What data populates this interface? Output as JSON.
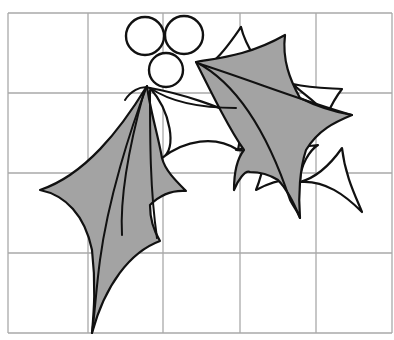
{
  "figure": {
    "colors": {
      "background": "#ffffff",
      "grid": "#a9a9a9",
      "outline": "#111111",
      "leaf_fill": "#a3a3a3",
      "berry_fill": "#ffffff"
    },
    "grid": {
      "left": 8,
      "top": 13,
      "right": 392,
      "bottom": 333,
      "columns": 5,
      "rows": 4,
      "vertical_lines": [
        8,
        88,
        163,
        240,
        316,
        392
      ],
      "horizontal_lines": [
        13,
        93,
        173,
        253,
        333
      ]
    },
    "berries": [
      {
        "name": "berry-left",
        "cx": 145,
        "cy": 36,
        "r": 19
      },
      {
        "name": "berry-right",
        "cx": 184,
        "cy": 35,
        "r": 19
      },
      {
        "name": "berry-bottom",
        "cx": 166,
        "cy": 70,
        "r": 17
      }
    ],
    "back_leaves": [
      {
        "name": "back-leaf-lower",
        "d": "M150 88 C170 110 178 150 162 158 C185 140 215 135 238 150 C240 138 242 128 250 120 C225 110 190 95 150 88 Z"
      },
      {
        "name": "back-leaf-lower-right",
        "d": "M236 150 C250 150 258 158 264 160 C262 175 258 185 256 190 C275 180 290 178 300 182 C300 165 310 150 318 145 C290 150 270 140 236 150 Z"
      },
      {
        "name": "back-leaf-right",
        "d": "M300 182 C325 180 345 195 362 212 C355 195 345 175 342 148 C330 165 315 178 300 182 Z"
      },
      {
        "name": "back-leaf-top",
        "d": "M212 62 C222 55 232 40 241 27 C244 40 250 50 255 58 C240 62 225 62 212 62 Z"
      },
      {
        "name": "back-leaf-top-right",
        "d": "M293 84 C310 88 325 88 342 89 C335 98 330 108 327 115 C315 100 300 92 293 84 Z"
      }
    ],
    "front_leaves": [
      {
        "name": "left-leaf",
        "d": "M147 86 C120 130 85 175 40 190 C65 195 85 215 92 250 C96 285 94 310 92 333 C105 285 130 252 160 241 C152 228 150 215 150 205 C160 195 172 190 186 191 C175 180 165 170 162 158 C158 135 150 110 147 86 Z"
      },
      {
        "name": "right-leaf",
        "d": "M196 62 C218 58 248 56 285 35 C282 60 290 80 300 98 C320 108 335 112 352 115 C335 122 318 130 306 150 C300 168 298 195 300 218 C292 198 286 188 278 180 C270 175 260 172 250 172 C245 170 238 180 234 190 C234 175 236 160 244 150 C230 130 215 100 196 62 Z"
      }
    ],
    "veins": [
      {
        "name": "left-leaf-midrib",
        "d": "M147 86 C130 130 108 200 100 260 C96 290 95 312 92 333"
      },
      {
        "name": "left-leaf-vein-inner",
        "d": "M144 92 C128 150 120 200 122 235"
      },
      {
        "name": "left-leaf-vein-right",
        "d": "M150 90 C150 140 150 190 157 238"
      },
      {
        "name": "right-leaf-midrib",
        "d": "M196 62 C240 85 270 140 290 200 C294 208 298 212 300 218"
      },
      {
        "name": "right-leaf-vein-upper",
        "d": "M200 64 C250 80 300 100 352 115"
      },
      {
        "name": "berry-stem-left",
        "d": "M150 88 C140 85 130 92 125 100"
      },
      {
        "name": "back-vein-arc",
        "d": "M150 88 C175 105 210 108 236 108"
      }
    ]
  }
}
